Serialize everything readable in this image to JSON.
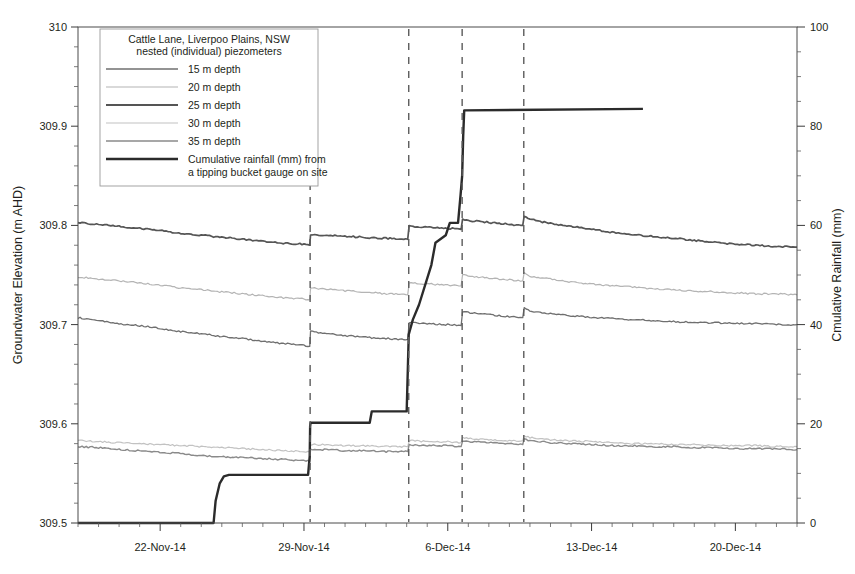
{
  "chart_data": {
    "type": "line",
    "title": "Cattle Lane, Liverpoo Plains, NSW",
    "subtitle": "nested (individual) piezometers",
    "xlabel": "",
    "ylabel": "Groundwater Elevation (m AHD)",
    "y2label": "Cmulative Rainfall (mm)",
    "grid": false,
    "legend_position": "top-left",
    "xlim": [
      "2014-11-18",
      "2014-12-23"
    ],
    "x_tick_labels": [
      "22-Nov-14",
      "29-Nov-14",
      "6-Dec-14",
      "13-Dec-14",
      "20-Dec-14"
    ],
    "x_tick_days": [
      4,
      11,
      18,
      25,
      32
    ],
    "x_minor_tick_interval_days": 1,
    "ylim": [
      309.5,
      310.0
    ],
    "y_tick_labels": [
      "309.5",
      "309.6",
      "309.7",
      "309.8",
      "309.9",
      "310"
    ],
    "y_tick_values": [
      309.5,
      309.6,
      309.7,
      309.8,
      309.9,
      310.0
    ],
    "y2lim": [
      0,
      100
    ],
    "y2_tick_labels": [
      "0",
      "20",
      "40",
      "60",
      "80",
      "100"
    ],
    "y2_tick_values": [
      0,
      20,
      40,
      60,
      80,
      100
    ],
    "event_lines_days": [
      11.3,
      16.1,
      18.7,
      21.7
    ],
    "series": [
      {
        "name": "15 m depth",
        "axis": "left",
        "color": "#6f6f6f",
        "width": 1.3,
        "x": [
          0,
          1,
          2,
          3,
          4,
          5,
          6,
          7,
          8,
          9,
          10,
          11,
          11.28,
          11.32,
          12,
          13,
          14,
          15,
          16.05,
          16.12,
          17,
          18,
          18.65,
          18.72,
          19,
          20,
          21,
          21.65,
          21.72,
          22,
          23,
          24,
          25,
          26,
          27,
          28,
          29,
          30,
          31,
          32,
          33,
          34,
          35
        ],
        "values": [
          309.707,
          309.704,
          309.701,
          309.699,
          309.696,
          309.693,
          309.691,
          309.688,
          309.686,
          309.683,
          309.681,
          309.679,
          309.678,
          309.693,
          309.691,
          309.689,
          309.687,
          309.686,
          309.685,
          309.702,
          309.701,
          309.7,
          309.699,
          309.713,
          309.712,
          309.71,
          309.708,
          309.707,
          309.717,
          309.714,
          309.711,
          309.709,
          309.707,
          309.706,
          309.705,
          309.704,
          309.703,
          309.702,
          309.702,
          309.701,
          309.701,
          309.7,
          309.7
        ]
      },
      {
        "name": "20 m depth",
        "axis": "left",
        "color": "#b4b4b4",
        "width": 1.2,
        "x": [
          0,
          1,
          2,
          3,
          4,
          5,
          6,
          7,
          8,
          9,
          10,
          11,
          11.28,
          11.32,
          12,
          13,
          14,
          15,
          16.05,
          16.12,
          17,
          18,
          18.65,
          18.72,
          19,
          20,
          21,
          21.65,
          21.72,
          22,
          23,
          24,
          25,
          26,
          27,
          28,
          29,
          30,
          31,
          32,
          33,
          34,
          35
        ],
        "values": [
          309.748,
          309.746,
          309.744,
          309.742,
          309.74,
          309.737,
          309.735,
          309.733,
          309.731,
          309.729,
          309.727,
          309.726,
          309.725,
          309.737,
          309.736,
          309.734,
          309.733,
          309.731,
          309.73,
          309.742,
          309.741,
          309.74,
          309.739,
          309.75,
          309.749,
          309.747,
          309.745,
          309.744,
          309.752,
          309.749,
          309.746,
          309.743,
          309.741,
          309.739,
          309.738,
          309.736,
          309.735,
          309.734,
          309.733,
          309.732,
          309.731,
          309.731,
          309.73
        ]
      },
      {
        "name": "25 m depth",
        "axis": "left",
        "color": "#555555",
        "width": 1.7,
        "x": [
          0,
          1,
          2,
          3,
          4,
          5,
          6,
          7,
          8,
          9,
          10,
          11,
          11.28,
          11.32,
          12,
          13,
          14,
          15,
          16.05,
          16.12,
          17,
          18,
          18.65,
          18.72,
          19,
          20,
          21,
          21.65,
          21.72,
          22,
          23,
          24,
          25,
          26,
          27,
          28,
          29,
          30,
          31,
          32,
          33,
          34,
          35
        ],
        "values": [
          309.803,
          309.801,
          309.799,
          309.797,
          309.795,
          309.792,
          309.79,
          309.788,
          309.786,
          309.784,
          309.782,
          309.781,
          309.78,
          309.791,
          309.79,
          309.789,
          309.788,
          309.787,
          309.786,
          309.799,
          309.798,
          309.797,
          309.796,
          309.806,
          309.805,
          309.803,
          309.801,
          309.8,
          309.81,
          309.806,
          309.802,
          309.799,
          309.796,
          309.793,
          309.791,
          309.789,
          309.787,
          309.785,
          309.783,
          309.781,
          309.78,
          309.779,
          309.778
        ]
      },
      {
        "name": "30 m depth",
        "axis": "left",
        "color": "#c2c2c2",
        "width": 1.2,
        "x": [
          0,
          1,
          2,
          3,
          4,
          5,
          6,
          7,
          8,
          9,
          10,
          11,
          11.28,
          11.32,
          12,
          13,
          14,
          15,
          16.05,
          16.12,
          17,
          18,
          18.65,
          18.72,
          19,
          20,
          21,
          21.65,
          21.72,
          22,
          23,
          24,
          25,
          26,
          27,
          28,
          29,
          30,
          31,
          32,
          33,
          34,
          35
        ],
        "values": [
          309.583,
          309.582,
          309.581,
          309.58,
          309.579,
          309.578,
          309.577,
          309.576,
          309.575,
          309.574,
          309.573,
          309.572,
          309.572,
          309.579,
          309.579,
          309.578,
          309.578,
          309.577,
          309.577,
          309.583,
          309.582,
          309.582,
          309.581,
          309.586,
          309.585,
          309.584,
          309.583,
          309.583,
          309.588,
          309.586,
          309.584,
          309.583,
          309.582,
          309.581,
          309.58,
          309.58,
          309.579,
          309.579,
          309.578,
          309.578,
          309.578,
          309.577,
          309.577
        ]
      },
      {
        "name": "35 m depth",
        "axis": "left",
        "color": "#8a8a8a",
        "width": 1.4,
        "x": [
          0,
          1,
          2,
          3,
          4,
          5,
          6,
          7,
          8,
          9,
          10,
          11,
          11.28,
          11.32,
          12,
          13,
          14,
          15,
          16.05,
          16.12,
          17,
          18,
          18.65,
          18.72,
          19,
          20,
          21,
          21.65,
          21.72,
          22,
          23,
          24,
          25,
          26,
          27,
          28,
          29,
          30,
          31,
          32,
          33,
          34,
          35
        ],
        "values": [
          309.577,
          309.576,
          309.574,
          309.573,
          309.571,
          309.57,
          309.568,
          309.567,
          309.566,
          309.565,
          309.564,
          309.563,
          309.562,
          309.574,
          309.574,
          309.573,
          309.573,
          309.572,
          309.572,
          309.579,
          309.578,
          309.578,
          309.577,
          309.583,
          309.582,
          309.581,
          309.58,
          309.579,
          309.585,
          309.583,
          309.581,
          309.58,
          309.579,
          309.578,
          309.578,
          309.577,
          309.577,
          309.576,
          309.576,
          309.575,
          309.575,
          309.575,
          309.574
        ]
      },
      {
        "name": "Cumulative rainfall (mm) from a tipping bucket gauge on site",
        "axis": "right",
        "color": "#2b2b2b",
        "width": 2.4,
        "x": [
          0,
          6.6,
          6.7,
          6.9,
          7.1,
          7.35,
          11.2,
          11.28,
          11.3,
          11.32,
          14.2,
          14.3,
          16.0,
          16.05,
          16.1,
          16.3,
          16.6,
          17.2,
          17.4,
          17.9,
          18.1,
          18.5,
          18.62,
          18.7,
          18.75,
          18.8,
          27.5
        ],
        "values": [
          0,
          0,
          4.5,
          8.0,
          9.4,
          9.7,
          9.7,
          13.5,
          19.5,
          20.2,
          20.2,
          22.5,
          22.5,
          30.2,
          38.0,
          41.0,
          44.0,
          52.0,
          56.5,
          58.0,
          60.5,
          60.5,
          66.0,
          70.0,
          78.0,
          83.2,
          83.5
        ]
      }
    ]
  },
  "legend": {
    "title_line1": "Cattle Lane, Liverpoo Plains, NSW",
    "title_line2": "nested (individual) piezometers",
    "entries": [
      {
        "label": "15 m depth",
        "color": "#6f6f6f",
        "width": 1.3
      },
      {
        "label": "20 m depth",
        "color": "#b4b4b4",
        "width": 1.2
      },
      {
        "label": "25 m depth",
        "color": "#555555",
        "width": 2.0
      },
      {
        "label": "30 m depth",
        "color": "#c2c2c2",
        "width": 1.2
      },
      {
        "label": "35 m depth",
        "color": "#8a8a8a",
        "width": 1.5
      }
    ],
    "rainfall_entry": {
      "label_line1": "Cumulative rainfall (mm) from",
      "label_line2": "a tipping bucket gauge on site",
      "color": "#2b2b2b",
      "width": 2.6
    }
  },
  "axes": {
    "y_left_title": "Groundwater Elevation (m AHD)",
    "y_right_title": "Cmulative Rainfall (mm)"
  }
}
